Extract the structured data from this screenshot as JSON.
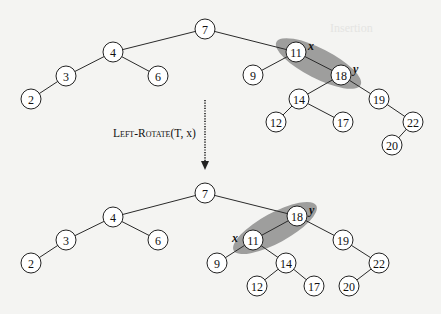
{
  "figure": {
    "operation_label_prefix": "Left-Rotate",
    "operation_label_args": "(T, x)",
    "arrow": "dotted-down-arrow",
    "section_ghost_text": "Insertion"
  },
  "trees": [
    {
      "name": "before",
      "root": 7,
      "highlight": {
        "from": 11,
        "to": 18,
        "color": "#8e8e8e"
      },
      "labels": [
        {
          "node": 11,
          "text": "x"
        },
        {
          "node": 18,
          "text": "y"
        }
      ],
      "nodes": [
        {
          "key": 7,
          "x": 205,
          "y": 29
        },
        {
          "key": 4,
          "x": 113,
          "y": 52
        },
        {
          "key": 3,
          "x": 66,
          "y": 76
        },
        {
          "key": 6,
          "x": 158,
          "y": 76
        },
        {
          "key": 2,
          "x": 31,
          "y": 99
        },
        {
          "key": 11,
          "x": 296,
          "y": 52
        },
        {
          "key": 9,
          "x": 253,
          "y": 75
        },
        {
          "key": 18,
          "x": 341,
          "y": 75
        },
        {
          "key": 14,
          "x": 299,
          "y": 99
        },
        {
          "key": 19,
          "x": 379,
          "y": 99
        },
        {
          "key": 12,
          "x": 276,
          "y": 122
        },
        {
          "key": 17,
          "x": 343,
          "y": 122
        },
        {
          "key": 22,
          "x": 413,
          "y": 122
        },
        {
          "key": 20,
          "x": 392,
          "y": 145
        }
      ],
      "edges": [
        [
          7,
          4
        ],
        [
          7,
          11
        ],
        [
          4,
          3
        ],
        [
          4,
          6
        ],
        [
          3,
          2
        ],
        [
          11,
          9
        ],
        [
          11,
          18
        ],
        [
          18,
          14
        ],
        [
          18,
          19
        ],
        [
          14,
          12
        ],
        [
          14,
          17
        ],
        [
          19,
          22
        ],
        [
          22,
          20
        ]
      ]
    },
    {
      "name": "after",
      "root": 7,
      "highlight": {
        "from": 11,
        "to": 18,
        "color": "#8e8e8e"
      },
      "labels": [
        {
          "node": 11,
          "text": "x"
        },
        {
          "node": 18,
          "text": "y"
        }
      ],
      "nodes": [
        {
          "key": 7,
          "x": 205,
          "y": 193
        },
        {
          "key": 4,
          "x": 113,
          "y": 217
        },
        {
          "key": 3,
          "x": 66,
          "y": 240
        },
        {
          "key": 6,
          "x": 158,
          "y": 240
        },
        {
          "key": 2,
          "x": 31,
          "y": 263
        },
        {
          "key": 18,
          "x": 297,
          "y": 216
        },
        {
          "key": 11,
          "x": 253,
          "y": 240
        },
        {
          "key": 19,
          "x": 343,
          "y": 240
        },
        {
          "key": 9,
          "x": 217,
          "y": 263
        },
        {
          "key": 14,
          "x": 286,
          "y": 263
        },
        {
          "key": 22,
          "x": 379,
          "y": 263
        },
        {
          "key": 12,
          "x": 257,
          "y": 286
        },
        {
          "key": 17,
          "x": 314,
          "y": 286
        },
        {
          "key": 20,
          "x": 349,
          "y": 286
        }
      ],
      "edges": [
        [
          7,
          4
        ],
        [
          7,
          18
        ],
        [
          4,
          3
        ],
        [
          4,
          6
        ],
        [
          3,
          2
        ],
        [
          18,
          11
        ],
        [
          18,
          19
        ],
        [
          11,
          9
        ],
        [
          11,
          14
        ],
        [
          14,
          12
        ],
        [
          14,
          17
        ],
        [
          19,
          22
        ],
        [
          22,
          20
        ]
      ]
    }
  ]
}
